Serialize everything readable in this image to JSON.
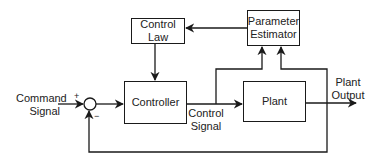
{
  "diagram": {
    "type": "block-diagram",
    "blocks": {
      "control_law": {
        "line1": "Control",
        "line2": "Law"
      },
      "parameter_estimator": {
        "line1": "Parameter",
        "line2": "Estimator"
      },
      "controller": {
        "label": "Controller"
      },
      "plant": {
        "label": "Plant"
      }
    },
    "signals": {
      "command": {
        "line1": "Command",
        "line2": "Signal"
      },
      "control": {
        "line1": "Control",
        "line2": "Signal"
      },
      "output": {
        "line1": "Plant",
        "line2": "Output"
      }
    },
    "summing_junction": {
      "plus": "+",
      "minus": "−"
    },
    "colors": {
      "line": "#1a1a1a",
      "text": "#222222",
      "background": "#ffffff"
    }
  }
}
